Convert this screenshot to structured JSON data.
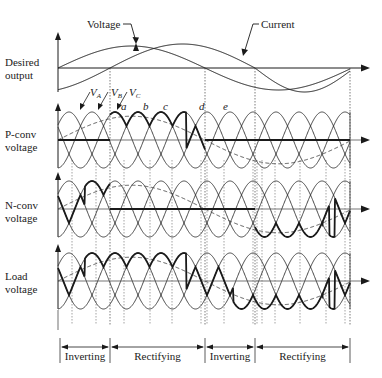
{
  "diagram": {
    "annotations": {
      "voltage_label": "Voltage",
      "current_label": "Current",
      "phase_labels": [
        {
          "name": "V",
          "sub": "A"
        },
        {
          "name": "V",
          "sub": "B"
        },
        {
          "name": "V",
          "sub": "C"
        }
      ],
      "points": [
        "a",
        "b",
        "c",
        "d",
        "e"
      ]
    },
    "rows": [
      {
        "id": "desired",
        "label_line1": "Desired",
        "label_line2": "output"
      },
      {
        "id": "pconv",
        "label_line1": "P-conv",
        "label_line2": "voltage"
      },
      {
        "id": "nconv",
        "label_line1": "N-conv",
        "label_line2": "voltage"
      },
      {
        "id": "load",
        "label_line1": "Load",
        "label_line2": "voltage"
      }
    ],
    "modes": [
      {
        "label": "Inverting",
        "x0": 60,
        "x1": 110
      },
      {
        "label": "Rectifying",
        "x0": 110,
        "x1": 205
      },
      {
        "label": "Inverting",
        "x0": 205,
        "x1": 255
      },
      {
        "label": "Rectifying",
        "x0": 255,
        "x1": 350
      }
    ],
    "colors": {
      "line": "#1a1a1a",
      "thin": "#333333",
      "dashed": "#444444",
      "axis": "#777777"
    }
  }
}
